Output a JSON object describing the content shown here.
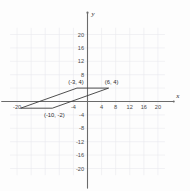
{
  "figure": {
    "axis_x_name": "x",
    "axis_y_name": "y",
    "vertex_labels": [
      {
        "text": "(-3, 4)",
        "x": -3,
        "y": 4
      },
      {
        "text": "(6, 4)",
        "x": 6,
        "y": 4
      },
      {
        "text": "(-10, -2)",
        "x": -10,
        "y": -2
      }
    ]
  },
  "chart_data": {
    "type": "scatter",
    "title": "",
    "xlabel": "x",
    "ylabel": "y",
    "xlim": [
      -22,
      22
    ],
    "ylim": [
      -22,
      22
    ],
    "grid": true,
    "grid_step": 4,
    "legend": "none",
    "x_ticks": [
      -20,
      -4,
      4,
      8,
      12,
      16,
      20
    ],
    "x_tick_labels": [
      "-20",
      "-4",
      "4",
      "8",
      "12",
      "16",
      "20"
    ],
    "y_ticks": [
      20,
      16,
      12,
      8,
      -4,
      -8,
      -12,
      -16,
      -20
    ],
    "y_tick_labels": [
      "20",
      "16",
      "12",
      "8",
      "-4",
      "-8",
      "-12",
      "-16",
      "-20"
    ],
    "series": [
      {
        "name": "parallelogram",
        "closed": true,
        "points": [
          {
            "x": -3,
            "y": 4,
            "label": "(-3, 4)"
          },
          {
            "x": 6,
            "y": 4,
            "label": "(6, 4)"
          },
          {
            "x": -10,
            "y": -2,
            "label": "(-10, -2)"
          },
          {
            "x": -19,
            "y": -2,
            "label": ""
          }
        ]
      }
    ],
    "annotations": [
      {
        "text": "(-3, 4)",
        "x": -3,
        "y": 4
      },
      {
        "text": "(6, 4)",
        "x": 6,
        "y": 4
      },
      {
        "text": "(-10, -2)",
        "x": -10,
        "y": -2
      }
    ]
  }
}
